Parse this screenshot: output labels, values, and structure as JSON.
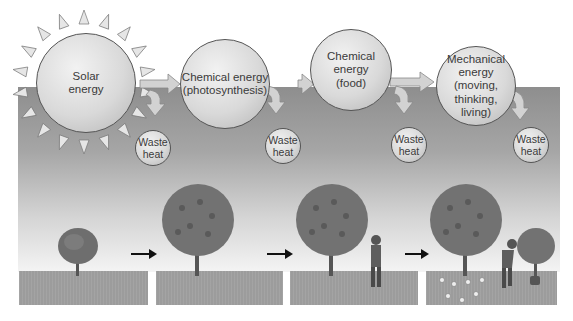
{
  "diagram": {
    "type": "energy-flow",
    "stages": [
      {
        "id": "solar",
        "label": "Solar\nenergy"
      },
      {
        "id": "chem-photo",
        "label": "Chemical energy\n(photosynthesis)"
      },
      {
        "id": "chem-food",
        "label": "Chemical\nenergy\n(food)"
      },
      {
        "id": "mechanical",
        "label": "Mechanical\nenergy\n(moving,\nthinking,\nliving)"
      }
    ],
    "waste_heat_label": "Waste\nheat",
    "waste_heat_count": 4,
    "panels": [
      {
        "id": "panel-1",
        "content": "small tree"
      },
      {
        "id": "panel-2",
        "content": "large fruit tree"
      },
      {
        "id": "panel-3",
        "content": "fruit tree and man eating"
      },
      {
        "id": "panel-4",
        "content": "fruit tree, man planting, young tree, fallen fruit"
      }
    ],
    "colors": {
      "sky_top": "#8e8e8e",
      "sky_bottom": "#f4f4f4",
      "ground": "#9c9c9c",
      "circle": "#d9d9d9",
      "arrow": "#cfcfcf"
    }
  }
}
